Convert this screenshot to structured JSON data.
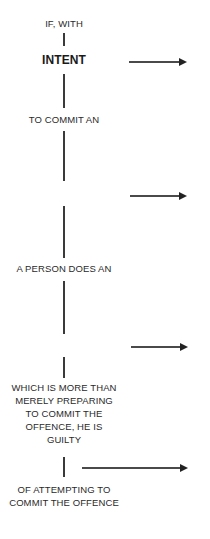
{
  "diagram": {
    "steps": [
      {
        "id": "if_with",
        "label": "IF, WITH"
      },
      {
        "id": "intent",
        "label": "INTENT",
        "emphasis": "bold"
      },
      {
        "id": "to_commit",
        "label": "TO COMMIT AN"
      },
      {
        "id": "person_does",
        "label": "A PERSON DOES AN"
      },
      {
        "id": "more_than",
        "lines": [
          "WHICH IS MORE THAN",
          "MERELY PREPARING",
          "TO COMMIT THE",
          "OFFENCE, HE IS",
          "GUILTY"
        ]
      },
      {
        "id": "of_attempting",
        "lines": [
          "OF ATTEMPTING TO",
          "COMMIT THE OFFENCE"
        ]
      }
    ],
    "arrows": [
      {
        "y": 61,
        "from_x": 129,
        "to_x": 187
      },
      {
        "y": 195,
        "from_x": 130,
        "to_x": 187
      },
      {
        "y": 346,
        "from_x": 131,
        "to_x": 188
      },
      {
        "y": 467,
        "from_x": 82,
        "to_x": 188
      }
    ],
    "colors": {
      "text": "#2a2a2a",
      "line": "#3a3a3a",
      "arrowhead": "#222222",
      "background": "#ffffff"
    }
  }
}
